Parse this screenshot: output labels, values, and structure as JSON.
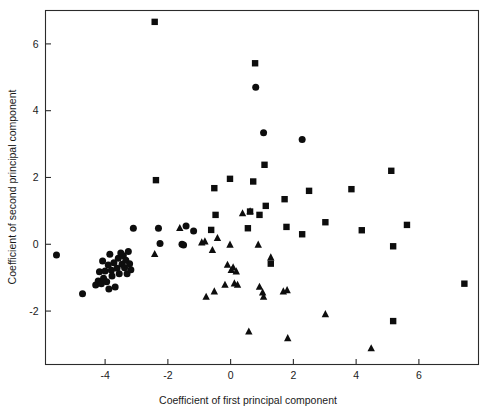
{
  "figure": {
    "background_color": "#ffffff",
    "marker_color": "#0d0d0d",
    "axis_color": "#2b2b2b"
  },
  "chart_data": {
    "type": "scatter",
    "title": "",
    "xlabel": "Coefficient of first principal component",
    "ylabel": "Coefficient of second principal component",
    "xlim": [
      -5.9,
      7.9
    ],
    "ylim": [
      -3.6,
      7.0
    ],
    "xticks": [
      -4,
      -2,
      0,
      2,
      4,
      6
    ],
    "yticks": [
      -2,
      0,
      2,
      4,
      6
    ],
    "xtick_labels": [
      "-4",
      "-2",
      "0",
      "2",
      "4",
      "6"
    ],
    "ytick_labels": [
      "-2",
      "0",
      "2",
      "4",
      "6"
    ],
    "grid": false,
    "legend": null,
    "series": [
      {
        "name": "circle-group",
        "marker": "circle",
        "color": "#0d0d0d",
        "points": [
          [
            -5.55,
            -0.32
          ],
          [
            -4.72,
            -1.48
          ],
          [
            -4.3,
            -1.22
          ],
          [
            -4.22,
            -1.1
          ],
          [
            -4.18,
            -0.82
          ],
          [
            -4.12,
            -1.18
          ],
          [
            -4.08,
            -0.5
          ],
          [
            -4.05,
            -1.02
          ],
          [
            -4.0,
            -0.8
          ],
          [
            -3.95,
            -1.12
          ],
          [
            -3.9,
            -0.62
          ],
          [
            -3.88,
            -1.34
          ],
          [
            -3.85,
            -0.3
          ],
          [
            -3.8,
            -0.78
          ],
          [
            -3.78,
            -0.95
          ],
          [
            -3.72,
            -0.55
          ],
          [
            -3.68,
            -1.28
          ],
          [
            -3.62,
            -0.72
          ],
          [
            -3.58,
            -0.42
          ],
          [
            -3.55,
            -0.88
          ],
          [
            -3.5,
            -0.26
          ],
          [
            -3.46,
            -0.6
          ],
          [
            -3.42,
            -0.34
          ],
          [
            -3.38,
            -0.7
          ],
          [
            -3.34,
            -0.48
          ],
          [
            -3.3,
            -0.88
          ],
          [
            -3.26,
            -0.22
          ],
          [
            -3.22,
            -0.58
          ],
          [
            -3.18,
            -0.76
          ],
          [
            -3.1,
            0.48
          ],
          [
            -2.3,
            0.48
          ],
          [
            -2.25,
            0.02
          ],
          [
            -1.55,
            0.0
          ],
          [
            -1.5,
            -0.02
          ],
          [
            -1.42,
            0.55
          ],
          [
            -1.18,
            0.4
          ],
          [
            0.8,
            4.7
          ],
          [
            1.05,
            3.34
          ],
          [
            2.28,
            3.14
          ]
        ]
      },
      {
        "name": "square-group",
        "marker": "square",
        "color": "#0d0d0d",
        "points": [
          [
            -2.42,
            6.66
          ],
          [
            -2.38,
            1.92
          ],
          [
            -0.52,
            1.68
          ],
          [
            -0.48,
            0.88
          ],
          [
            -0.62,
            0.43
          ],
          [
            -0.02,
            1.96
          ],
          [
            0.55,
            0.48
          ],
          [
            0.62,
            0.98
          ],
          [
            0.72,
            1.88
          ],
          [
            0.78,
            5.42
          ],
          [
            0.92,
            0.88
          ],
          [
            1.08,
            2.38
          ],
          [
            1.12,
            1.15
          ],
          [
            1.28,
            -0.58
          ],
          [
            1.72,
            1.35
          ],
          [
            1.78,
            0.52
          ],
          [
            2.28,
            0.3
          ],
          [
            2.5,
            1.6
          ],
          [
            3.02,
            0.66
          ],
          [
            3.85,
            1.65
          ],
          [
            4.18,
            0.42
          ],
          [
            5.12,
            2.2
          ],
          [
            5.18,
            -0.06
          ],
          [
            5.18,
            -2.3
          ],
          [
            5.62,
            0.58
          ],
          [
            7.45,
            -1.18
          ]
        ]
      },
      {
        "name": "triangle-group",
        "marker": "triangle",
        "color": "#0d0d0d",
        "points": [
          [
            -2.42,
            -0.3
          ],
          [
            -1.62,
            0.48
          ],
          [
            -0.92,
            0.05
          ],
          [
            -0.82,
            0.08
          ],
          [
            -0.78,
            -1.58
          ],
          [
            -0.58,
            -0.18
          ],
          [
            -0.52,
            -1.42
          ],
          [
            -0.42,
            0.18
          ],
          [
            -0.18,
            -1.22
          ],
          [
            -0.1,
            -0.62
          ],
          [
            -0.02,
            -0.02
          ],
          [
            0.02,
            -0.78
          ],
          [
            0.08,
            -0.7
          ],
          [
            0.12,
            -1.18
          ],
          [
            0.18,
            -0.82
          ],
          [
            0.22,
            -1.22
          ],
          [
            0.38,
            0.92
          ],
          [
            0.58,
            -2.62
          ],
          [
            0.62,
            0.98
          ],
          [
            0.88,
            -0.02
          ],
          [
            0.92,
            -1.28
          ],
          [
            1.02,
            -1.45
          ],
          [
            1.05,
            -1.58
          ],
          [
            1.28,
            -0.4
          ],
          [
            1.68,
            -1.42
          ],
          [
            1.8,
            -1.38
          ],
          [
            1.82,
            -2.82
          ],
          [
            3.02,
            -2.1
          ],
          [
            4.48,
            -3.12
          ]
        ]
      }
    ]
  },
  "axis": {
    "x_title": "Coefficient of first principal component",
    "y_title": "Coefficient of second principal component"
  }
}
